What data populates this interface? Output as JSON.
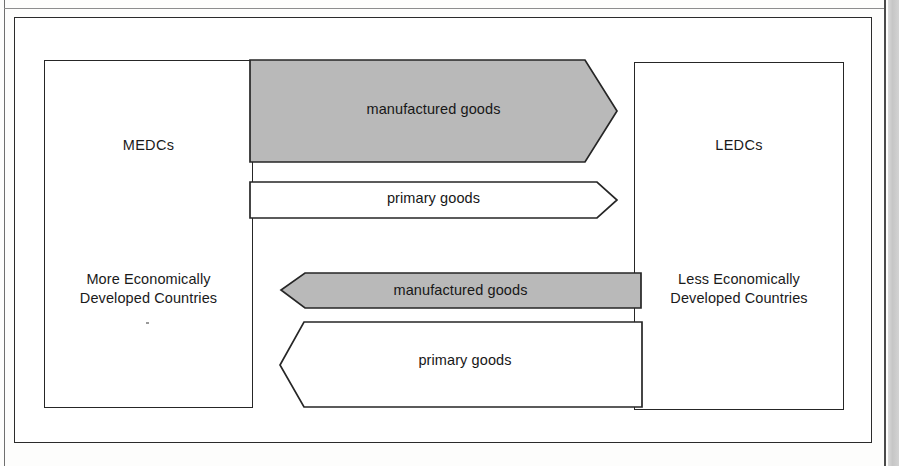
{
  "diagram": {
    "nodes": [
      {
        "id": "medcs",
        "abbrev": "MEDCs",
        "full_name_line1": "More Economically",
        "full_name_line2": "Developed Countries"
      },
      {
        "id": "ledcs",
        "abbrev": "LEDCs",
        "full_name_line1": "Less Economically",
        "full_name_line2": "Developed Countries"
      }
    ],
    "flows": [
      {
        "id": "mfg-export",
        "label": "manufactured goods",
        "from": "MEDCs",
        "to": "LEDCs",
        "direction": "right",
        "style": "shaded",
        "magnitude": "large"
      },
      {
        "id": "prim-export",
        "label": "primary goods",
        "from": "MEDCs",
        "to": "LEDCs",
        "direction": "right",
        "style": "hollow",
        "magnitude": "small"
      },
      {
        "id": "mfg-import",
        "label": "manufactured goods",
        "from": "LEDCs",
        "to": "MEDCs",
        "direction": "left",
        "style": "shaded",
        "magnitude": "small"
      },
      {
        "id": "prim-import",
        "label": "primary goods",
        "from": "LEDCs",
        "to": "MEDCs",
        "direction": "left",
        "style": "hollow",
        "magnitude": "large"
      }
    ],
    "colors": {
      "shaded_fill": "#b9b9b9",
      "hollow_fill": "#ffffff",
      "stroke": "#262626",
      "text": "#171717",
      "page_background": "#ffffff"
    }
  }
}
